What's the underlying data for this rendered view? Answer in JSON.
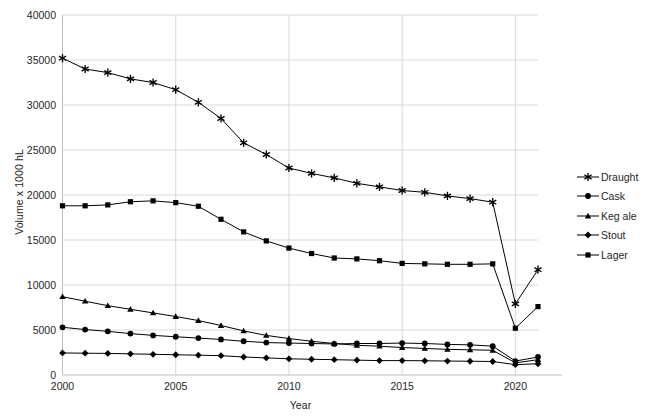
{
  "chart_data": {
    "type": "line",
    "title": "",
    "xlabel": "Year",
    "ylabel": "Volume x 1000 hL",
    "xlim": [
      2000,
      2021
    ],
    "ylim": [
      0,
      40000
    ],
    "x": [
      2000,
      2001,
      2002,
      2003,
      2004,
      2005,
      2006,
      2007,
      2008,
      2009,
      2010,
      2011,
      2012,
      2013,
      2014,
      2015,
      2016,
      2017,
      2018,
      2019,
      2020,
      2021
    ],
    "xticks": [
      "2000",
      "2005",
      "2010",
      "2015",
      "2020"
    ],
    "yticks": [
      "0",
      "5000",
      "10000",
      "15000",
      "20000",
      "25000",
      "30000",
      "35000",
      "40000"
    ],
    "grid": true,
    "legend_position": "right",
    "series": [
      {
        "name": "Draught",
        "marker": "asterisk",
        "values": [
          35200,
          34000,
          33600,
          32900,
          32500,
          31700,
          30300,
          28500,
          25800,
          24500,
          23000,
          22400,
          21900,
          21300,
          20900,
          20500,
          20300,
          19900,
          19600,
          19200,
          7900,
          11700
        ]
      },
      {
        "name": "Cask",
        "marker": "circle",
        "values": [
          5300,
          5050,
          4850,
          4600,
          4400,
          4250,
          4100,
          3950,
          3750,
          3600,
          3550,
          3500,
          3450,
          3500,
          3500,
          3550,
          3500,
          3400,
          3350,
          3200,
          1550,
          2000
        ]
      },
      {
        "name": "Keg ale",
        "marker": "triangle",
        "values": [
          8700,
          8200,
          7700,
          7300,
          6900,
          6500,
          6050,
          5500,
          4900,
          4400,
          4050,
          3750,
          3500,
          3300,
          3200,
          3050,
          2950,
          2850,
          2800,
          2750,
          1350,
          1700
        ]
      },
      {
        "name": "Stout",
        "marker": "diamond",
        "values": [
          2450,
          2420,
          2400,
          2350,
          2300,
          2250,
          2200,
          2150,
          2000,
          1900,
          1800,
          1750,
          1700,
          1650,
          1600,
          1600,
          1580,
          1550,
          1530,
          1500,
          1150,
          1250
        ]
      },
      {
        "name": "Lager",
        "marker": "square",
        "values": [
          18800,
          18800,
          18900,
          19250,
          19350,
          19150,
          18750,
          17300,
          15900,
          14900,
          14100,
          13500,
          13000,
          12900,
          12700,
          12400,
          12350,
          12300,
          12300,
          12350,
          5200,
          7600
        ]
      }
    ]
  },
  "legend": {
    "items": [
      {
        "label": "Draught"
      },
      {
        "label": "Cask"
      },
      {
        "label": "Keg ale"
      },
      {
        "label": "Stout"
      },
      {
        "label": "Lager"
      }
    ]
  },
  "colors": {
    "series": "#000000",
    "grid": "#d9d9d9",
    "axis": "#bfbfbf",
    "text": "#262626",
    "background": "#ffffff"
  }
}
